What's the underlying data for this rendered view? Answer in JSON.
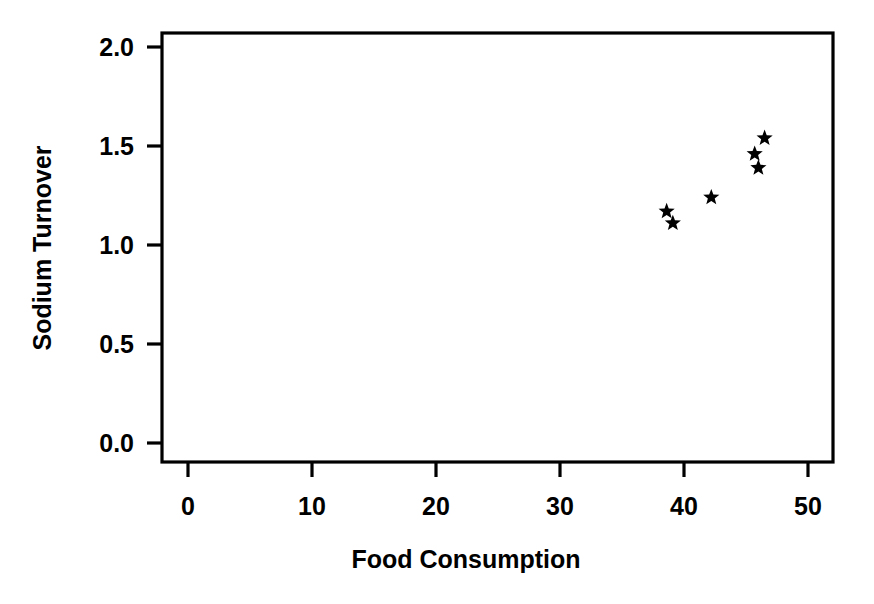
{
  "chart_data": {
    "type": "scatter",
    "title": "",
    "xlabel": "Food Consumption",
    "ylabel": "Sodium Turnover",
    "xlim": [
      -1.1,
      52.0
    ],
    "ylim": [
      -0.08,
      2.17
    ],
    "grid": false,
    "legend": null,
    "marker": "star",
    "marker_color": "#000000",
    "xticks": [
      0,
      10,
      20,
      30,
      40,
      50
    ],
    "xtick_labels": [
      "0",
      "10",
      "20",
      "30",
      "40",
      "50"
    ],
    "yticks": [
      0.0,
      0.5,
      1.0,
      1.5,
      2.0
    ],
    "ytick_labels": [
      "0.0",
      "0.5",
      "1.0",
      "1.5",
      "2.0"
    ],
    "x": [
      38.6,
      39.1,
      42.2,
      45.7,
      46.0,
      46.5
    ],
    "y": [
      1.17,
      1.11,
      1.24,
      1.46,
      1.39,
      1.54
    ],
    "points": [
      {
        "x": 38.6,
        "y": 1.17
      },
      {
        "x": 39.1,
        "y": 1.11
      },
      {
        "x": 42.2,
        "y": 1.24
      },
      {
        "x": 45.7,
        "y": 1.46
      },
      {
        "x": 46.0,
        "y": 1.39
      },
      {
        "x": 46.5,
        "y": 1.54
      }
    ]
  },
  "axes": {
    "x_title": "Food Consumption",
    "y_title": "Sodium Turnover",
    "x_tick_labels": [
      "0",
      "10",
      "20",
      "30",
      "40",
      "50"
    ],
    "y_tick_labels": [
      "0.0",
      "0.5",
      "1.0",
      "1.5",
      "2.0"
    ]
  },
  "colors": {
    "background": "#ffffff",
    "foreground": "#000000",
    "marker": "#000000"
  }
}
